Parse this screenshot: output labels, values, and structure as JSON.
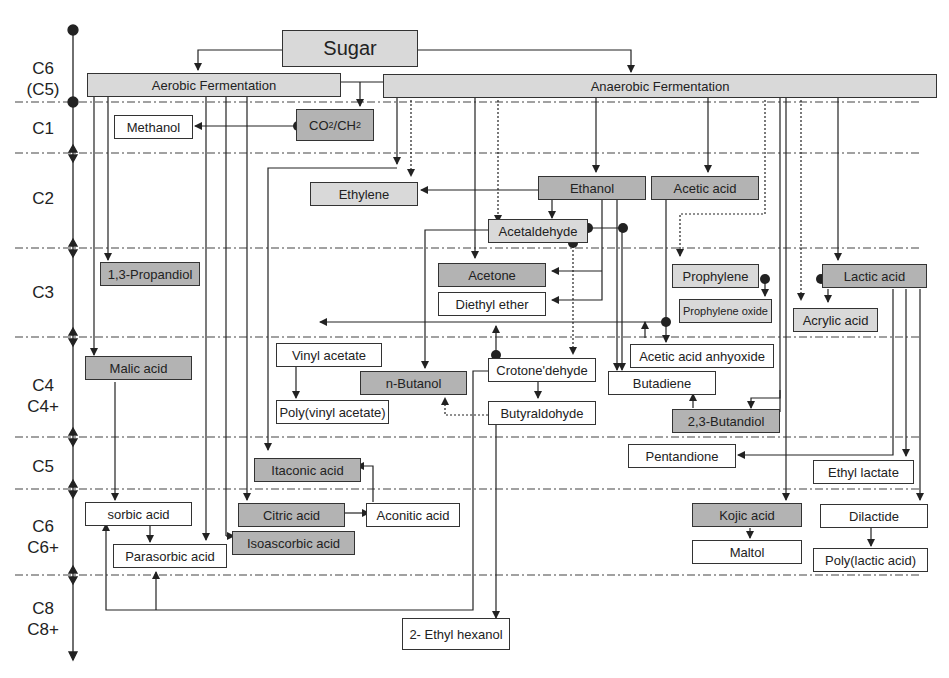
{
  "diagram": {
    "title_node": "Sugar",
    "branches": {
      "aerobic": "Aerobic Fermentation",
      "anaerobic": "Anaerobic Fermentation"
    },
    "levels": [
      {
        "id": "c6c5",
        "line1": "C6",
        "line2": "(C5)"
      },
      {
        "id": "c1",
        "line1": "C1",
        "line2": ""
      },
      {
        "id": "c2",
        "line1": "C2",
        "line2": ""
      },
      {
        "id": "c3",
        "line1": "C3",
        "line2": ""
      },
      {
        "id": "c4",
        "line1": "C4",
        "line2": "C4+"
      },
      {
        "id": "c5",
        "line1": "C5",
        "line2": ""
      },
      {
        "id": "c6",
        "line1": "C6",
        "line2": "C6+"
      },
      {
        "id": "c8",
        "line1": "C8",
        "line2": "C8+"
      }
    ],
    "nodes": {
      "methanol": "Methanol",
      "co2_main": "CO",
      "co2_sub1": "2",
      "co2_mid": "/CH",
      "co2_sub2": "2",
      "ethylene": "Ethylene",
      "ethanol": "Ethanol",
      "acetic_acid": "Acetic acid",
      "acetaldehyde": "Acetaldehyde",
      "propandiol": "1,3-Propandiol",
      "acetone": "Acetone",
      "diethyl_ether": "Diethyl ether",
      "prophylene": "Prophylene",
      "prophylene_oxide": "Prophylene oxide",
      "lactic_acid": "Lactic acid",
      "acrylic_acid": "Acrylic acid",
      "malic_acid": "Malic acid",
      "vinyl_acetate": "Vinyl acetate",
      "n_butanol": "n-Butanol",
      "poly_vinyl_acetate": "Poly(vinyl acetate)",
      "crotonedehyde": "Crotone'dehyde",
      "butyraldohyde": "Butyraldohyde",
      "acetic_anhydride": "Acetic acid anhyoxide",
      "butadiene": "Butadiene",
      "butandiol": "2,3-Butandiol",
      "itaconic_acid": "Itaconic acid",
      "pentandione": "Pentandione",
      "ethyl_lactate": "Ethyl lactate",
      "sorbic_acid": "sorbic acid",
      "citric_acid": "Citric acid",
      "aconitic_acid": "Aconitic acid",
      "isoascorbic_acid": "Isoascorbic acid",
      "parasorbic_acid": "Parasorbic acid",
      "kojic_acid": "Kojic acid",
      "maltol": "Maltol",
      "dilactide": "Dilactide",
      "poly_lactic_acid": "Poly(lactic acid)",
      "ethyl_hexanol": "2- Ethyl hexanol"
    },
    "colors": {
      "light_fill": "#d9d9d9",
      "dark_fill": "#b3b3b3",
      "line": "#333333"
    }
  }
}
